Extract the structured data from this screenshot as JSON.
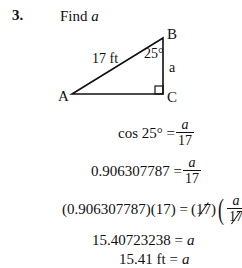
{
  "problem": {
    "number": "3.",
    "prompt_text": "Find ",
    "prompt_var": "a"
  },
  "triangle": {
    "vertices": {
      "A": "A",
      "B": "B",
      "C": "C"
    },
    "hypotenuse_label": "17 ft",
    "angle_label": "25°",
    "side_label": "a",
    "right_angle_at": "C"
  },
  "solution": {
    "step1": {
      "lhs": "cos 25° =",
      "num": "a",
      "den": "17"
    },
    "step2": {
      "lhs": "0.906307787 =",
      "num": "a",
      "den": "17"
    },
    "step3": {
      "lhs": "(0.906307787)(17) =",
      "cancel_left": "17",
      "num": "a",
      "den": "17"
    },
    "step4": {
      "lhs": "15.40723238 =",
      "rhs": "a"
    },
    "step5": {
      "lhs": "15.41 ft =",
      "rhs": "a"
    }
  }
}
